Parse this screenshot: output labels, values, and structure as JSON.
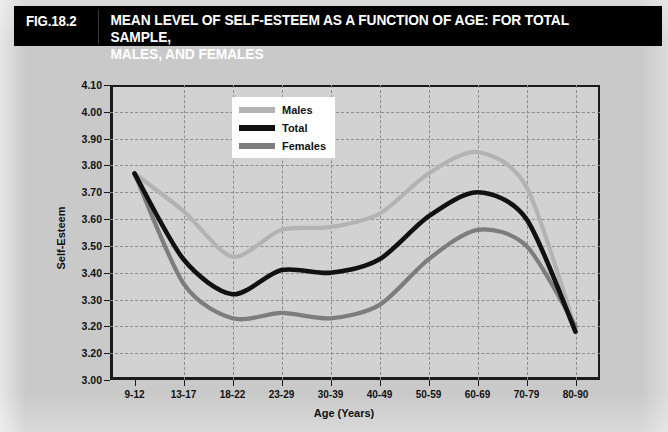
{
  "figure": {
    "number_label": "FIG.18.2",
    "title": "MEAN LEVEL OF SELF-ESTEEM AS A FUNCTION OF AGE: FOR TOTAL SAMPLE,\nMALES, AND FEMALES",
    "title_bar_bg": "#000000",
    "title_text_color": "#ffffff",
    "board_bg": "#c9c9c9",
    "plot_bg": "#d2d2d2"
  },
  "legend": {
    "position": "inside-top-center",
    "entries": [
      {
        "label": "Males",
        "color": "#b3b3b3"
      },
      {
        "label": "Total",
        "color": "#111111"
      },
      {
        "label": "Females",
        "color": "#7d7d7d"
      }
    ]
  },
  "axes": {
    "y_title": "Self-Esteem",
    "x_title": "Age (Years)",
    "y_ticks": [
      "4.10",
      "4.00",
      "3.90",
      "3.80",
      "3.70",
      "3.60",
      "3.50",
      "3.40",
      "3.30",
      "3.20",
      "3.20",
      "3.00"
    ],
    "x_ticks": [
      "9-12",
      "13-17",
      "18-22",
      "23-29",
      "30-39",
      "40-49",
      "50-59",
      "60-69",
      "70-79",
      "80-90"
    ]
  },
  "chart_data": {
    "type": "line",
    "title": "MEAN LEVEL OF SELF-ESTEEM AS A FUNCTION OF AGE: FOR TOTAL SAMPLE, MALES, AND FEMALES",
    "xlabel": "Age (Years)",
    "ylabel": "Self-Esteem",
    "categories": [
      "9-12",
      "13-17",
      "18-22",
      "23-29",
      "30-39",
      "40-49",
      "50-59",
      "60-69",
      "70-79",
      "80-90"
    ],
    "ylim": [
      3.0,
      4.1
    ],
    "ytick_values": [
      4.1,
      4.0,
      3.9,
      3.8,
      3.7,
      3.6,
      3.5,
      3.4,
      3.3,
      3.2,
      3.1,
      3.0
    ],
    "ytick_labels_as_printed": [
      "4.10",
      "4.00",
      "3.90",
      "3.80",
      "3.70",
      "3.60",
      "3.50",
      "3.40",
      "3.30",
      "3.20",
      "3.20",
      "3.00"
    ],
    "grid": true,
    "legend_position": "upper center",
    "series": [
      {
        "name": "Males",
        "color": "#b3b3b3",
        "values": [
          3.77,
          3.63,
          3.46,
          3.56,
          3.57,
          3.62,
          3.77,
          3.85,
          3.72,
          3.19
        ]
      },
      {
        "name": "Total",
        "color": "#111111",
        "values": [
          3.77,
          3.45,
          3.32,
          3.41,
          3.4,
          3.45,
          3.61,
          3.7,
          3.6,
          3.18
        ]
      },
      {
        "name": "Females",
        "color": "#7d7d7d",
        "values": [
          3.77,
          3.36,
          3.23,
          3.25,
          3.23,
          3.28,
          3.45,
          3.56,
          3.5,
          3.2
        ]
      }
    ]
  }
}
